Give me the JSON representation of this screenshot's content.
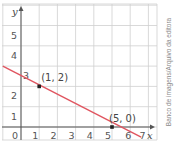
{
  "chart_data": {
    "type": "line",
    "title": "",
    "xlabel": "x",
    "ylabel": "y",
    "xlim": [
      -1,
      7.5
    ],
    "ylim": [
      -0.5,
      5.6
    ],
    "grid": true,
    "x_ticks": [
      "0",
      "1",
      "2",
      "3",
      "4",
      "5",
      "6",
      "7"
    ],
    "y_ticks": [
      "1",
      "2",
      "3",
      "4",
      "5"
    ],
    "series": [
      {
        "name": "line",
        "x": [
          -1,
          6.6
        ],
        "y": [
          3.0,
          -0.5
        ],
        "equation": "y = -0.5x + 2.5",
        "color": "#e05560"
      }
    ],
    "points": [
      {
        "x": 1,
        "y": 2,
        "label": "(1, 2)"
      },
      {
        "x": 5,
        "y": 0,
        "label": "(5, 0)"
      }
    ]
  },
  "credit": "Banco de imagens/Arquivo da editora"
}
